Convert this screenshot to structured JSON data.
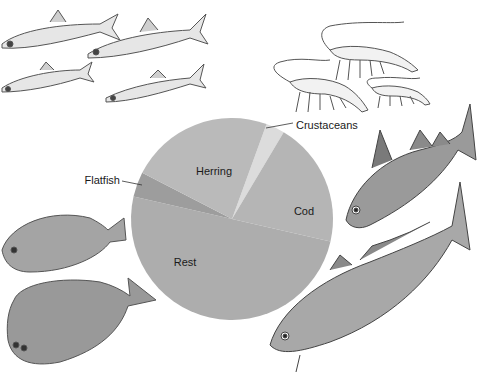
{
  "chart_data": {
    "type": "pie",
    "title": "",
    "center": [
      232,
      219
    ],
    "radius": 101,
    "start_angle_deg": 20,
    "slices": [
      {
        "label": "Crustaceans",
        "value": 3,
        "color": "#dcdcdc",
        "label_pos": [
          296,
          129
        ],
        "label_anchor": "start",
        "leader": [
          [
            266,
            128
          ],
          [
            293,
            123
          ]
        ]
      },
      {
        "label": "Cod",
        "value": 20,
        "color": "#b5b5b5",
        "label_pos": [
          304,
          215
        ],
        "label_anchor": "middle"
      },
      {
        "label": "Rest",
        "value": 50,
        "color": "#adadad",
        "label_pos": [
          185,
          266
        ],
        "label_anchor": "middle"
      },
      {
        "label": "Flatfish",
        "value": 4,
        "color": "#9d9d9d",
        "label_pos": [
          120,
          184
        ],
        "label_anchor": "end",
        "leader": [
          [
            122,
            181
          ],
          [
            142,
            185
          ]
        ]
      },
      {
        "label": "Herring",
        "value": 23,
        "color": "#bababa",
        "label_pos": [
          214,
          175
        ],
        "label_anchor": "middle"
      }
    ],
    "legend": "none",
    "annotations": [
      "Illustrations of herring, crustaceans (shrimp), cod and flatfish surround the pie"
    ]
  },
  "illustrations": [
    {
      "name": "herring-group",
      "caption": ""
    },
    {
      "name": "shrimp-group",
      "caption": ""
    },
    {
      "name": "cod-group",
      "caption": ""
    },
    {
      "name": "flatfish-group",
      "caption": ""
    }
  ]
}
